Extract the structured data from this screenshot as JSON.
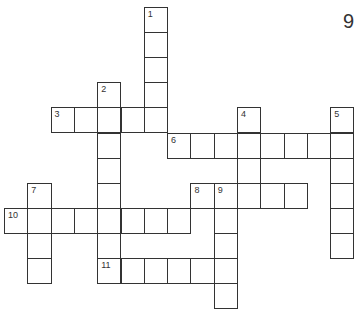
{
  "page_number": "9",
  "puzzle": {
    "entries": [
      {
        "number": "1",
        "direction": "down",
        "row": 0,
        "col": 6,
        "length": 5
      },
      {
        "number": "2",
        "direction": "down",
        "row": 3,
        "col": 4,
        "length": 8
      },
      {
        "number": "3",
        "direction": "across",
        "row": 4,
        "col": 2,
        "length": 5
      },
      {
        "number": "4",
        "direction": "down",
        "row": 4,
        "col": 10,
        "length": 4
      },
      {
        "number": "5",
        "direction": "down",
        "row": 4,
        "col": 14,
        "length": 6
      },
      {
        "number": "6",
        "direction": "across",
        "row": 5,
        "col": 7,
        "length": 8
      },
      {
        "number": "7",
        "direction": "down",
        "row": 7,
        "col": 1,
        "length": 4
      },
      {
        "number": "8",
        "direction": "across",
        "row": 7,
        "col": 8,
        "length": 5
      },
      {
        "number": "9",
        "direction": "down",
        "row": 7,
        "col": 9,
        "length": 5
      },
      {
        "number": "10",
        "direction": "across",
        "row": 8,
        "col": 0,
        "length": 8
      },
      {
        "number": "11",
        "direction": "across",
        "row": 10,
        "col": 4,
        "length": 6
      }
    ]
  }
}
